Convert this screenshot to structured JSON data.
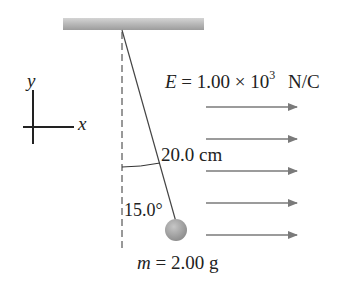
{
  "diagram": {
    "type": "pendulum-in-electric-field",
    "axes": {
      "x_label": "x",
      "y_label": "y"
    },
    "field": {
      "symbol": "E",
      "equals": "=",
      "value_mantissa": "1.00",
      "times": "×",
      "base": "10",
      "exponent": "3",
      "units": "N/C",
      "arrow_count": 5,
      "direction": "+x"
    },
    "string_length": "20.0 cm",
    "angle": "15.0°",
    "mass": {
      "symbol": "m",
      "equals": "=",
      "value": "2.00 g"
    },
    "colors": {
      "ceiling": "#a9a9a9",
      "string": "#444444",
      "field_arrow": "#7a7a7a",
      "ball": "#9a9a9a",
      "text": "#222222"
    }
  }
}
